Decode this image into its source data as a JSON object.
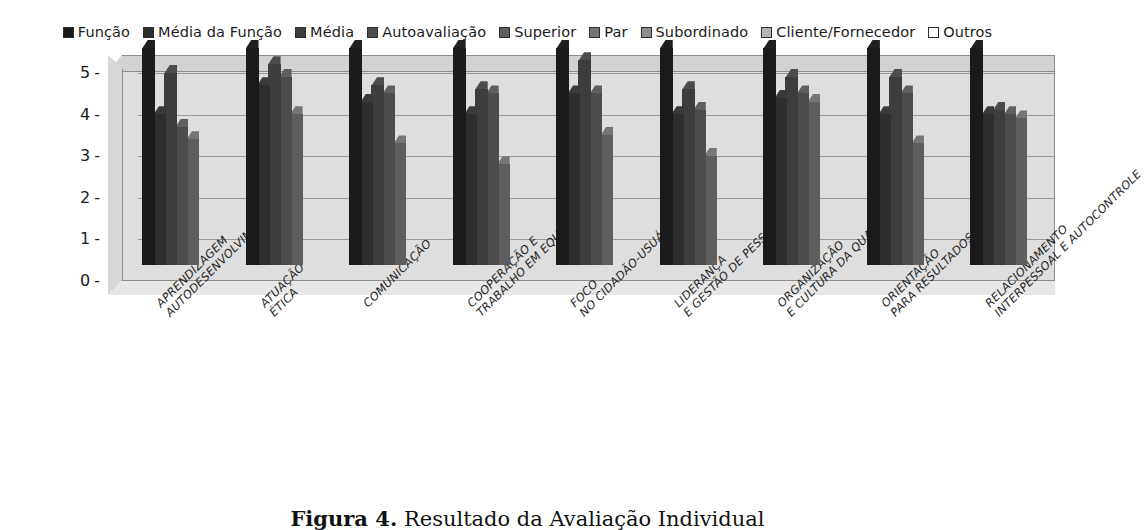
{
  "legend": {
    "position": "top-center",
    "items": [
      {
        "label": "Função",
        "color": "#1a1a1a",
        "name": "legend-funcao"
      },
      {
        "label": "Média da Função",
        "color": "#2e2e2e",
        "name": "legend-media-da-funcao"
      },
      {
        "label": "Média",
        "color": "#3d3d3d",
        "name": "legend-media"
      },
      {
        "label": "Autoavaliação",
        "color": "#4c4c4c",
        "name": "legend-autoavaliacao"
      },
      {
        "label": "Superior",
        "color": "#5e5e5e",
        "name": "legend-superior"
      },
      {
        "label": "Par",
        "color": "#757575",
        "name": "legend-par"
      },
      {
        "label": "Subordinado",
        "color": "#8e8e8e",
        "name": "legend-subordinado"
      },
      {
        "label": "Cliente/Fornecedor",
        "color": "#b5b5b5",
        "name": "legend-cliente-fornecedor"
      },
      {
        "label": "Outros",
        "color": "#ffffff",
        "name": "legend-outros"
      }
    ]
  },
  "axis": {
    "y_ticks": [
      "5",
      "4",
      "3",
      "2",
      "1",
      "0"
    ],
    "y_min": 0,
    "y_max": 5,
    "dash": "-"
  },
  "caption": {
    "figure_label": "Figura 4.",
    "text": "Resultado da Avaliação Individual"
  },
  "chart_data": {
    "type": "bar",
    "title": "",
    "subtitle": "",
    "xlabel": "",
    "ylabel": "",
    "ylim": [
      0,
      5
    ],
    "grid": true,
    "legend_position": "top",
    "style": "3d-clustered-grayscale-scan",
    "categories": [
      "APRENDIZAGEM\nAUTODESENVOLVIMENTO",
      "ATUAÇÃO\nÉTICA",
      "COMUNICAÇÃO",
      "COOPERAÇÃO E\nTRABALHO EM EQUIPE",
      "FOCO\nNO CIDADÃO-USUÁRIO",
      "LIDERANÇA\nE GESTÃO DE PESSOAS",
      "ORGANIZAÇÃO\nE CULTURA DA QUALIDADE",
      "ORIENTAÇÃO\nPARA RESULTADOS",
      "RELACIONAMENTO\nINTERPESSOAL E AUTOCONTROLE"
    ],
    "category_lines": [
      [
        "APRENDIZAGEM",
        "AUTODESENVOLVIMENTO"
      ],
      [
        "ATUAÇÃO",
        "ÉTICA"
      ],
      [
        "COMUNICAÇÃO",
        ""
      ],
      [
        "COOPERAÇÃO E",
        "TRABALHO EM EQUIPE"
      ],
      [
        "FOCO",
        "NO CIDADÃO-USUÁRIO"
      ],
      [
        "LIDERANÇA",
        "E GESTÃO DE PESSOAS"
      ],
      [
        "ORGANIZAÇÃO",
        "E CULTURA DA QUALIDADE"
      ],
      [
        "ORIENTAÇÃO",
        "PARA RESULTADOS"
      ],
      [
        "RELACIONAMENTO",
        "INTERPESSOAL E AUTOCONTROLE"
      ]
    ],
    "series": [
      {
        "name": "Função",
        "color": "#1a1a1a",
        "values": [
          5.2,
          5.2,
          5.2,
          5.2,
          5.2,
          5.2,
          5.2,
          5.2,
          5.2
        ]
      },
      {
        "name": "Média da Função",
        "color": "#2e2e2e",
        "values": [
          3.6,
          4.3,
          3.9,
          3.6,
          4.1,
          3.6,
          4.0,
          3.6,
          3.6
        ]
      },
      {
        "name": "Média",
        "color": "#3d3d3d",
        "values": [
          4.6,
          4.8,
          4.3,
          4.2,
          4.9,
          4.2,
          4.5,
          4.5,
          3.7
        ]
      },
      {
        "name": "Autoavaliação",
        "color": "#4c4c4c",
        "values": [
          3.3,
          4.5,
          4.1,
          4.1,
          4.1,
          3.7,
          4.1,
          4.1,
          3.6
        ]
      },
      {
        "name": "Superior",
        "color": "#5e5e5e",
        "values": [
          3.0,
          3.6,
          2.9,
          2.4,
          3.1,
          2.6,
          3.9,
          2.9,
          3.5
        ]
      },
      {
        "name": "Par",
        "color": "#757575",
        "values": [
          null,
          null,
          null,
          null,
          null,
          null,
          null,
          null,
          null
        ]
      },
      {
        "name": "Subordinado",
        "color": "#8e8e8e",
        "values": [
          null,
          null,
          null,
          null,
          null,
          null,
          null,
          null,
          null
        ]
      },
      {
        "name": "Cliente/Fornecedor",
        "color": "#b5b5b5",
        "values": [
          null,
          null,
          null,
          null,
          null,
          null,
          null,
          null,
          null
        ]
      },
      {
        "name": "Outros",
        "color": "#ffffff",
        "values": [
          null,
          null,
          null,
          null,
          null,
          null,
          null,
          null,
          null
        ]
      }
    ]
  }
}
